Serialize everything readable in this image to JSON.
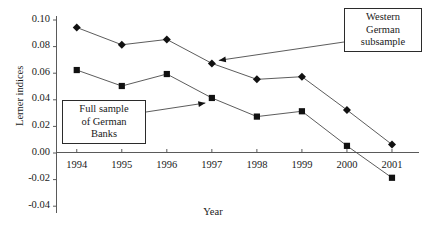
{
  "chart_data": {
    "type": "line",
    "title": "",
    "xlabel": "Year",
    "ylabel": "Lerner indices",
    "categories": [
      "1994",
      "1995",
      "1996",
      "1997",
      "1998",
      "1999",
      "2000",
      "2001"
    ],
    "x": [
      1994,
      1995,
      1996,
      1997,
      1998,
      1999,
      2000,
      2001
    ],
    "xlim": [
      1993.55,
      2001.6
    ],
    "ylim": [
      -0.04,
      0.1
    ],
    "yticks": [
      0.1,
      0.08,
      0.06,
      0.04,
      0.02,
      0.0,
      -0.02,
      -0.04
    ],
    "ytick_labels": [
      "0.10",
      "0.08",
      "0.06",
      "0.04",
      "0.02",
      "0.00",
      "-0.02",
      "-0.04"
    ],
    "grid": false,
    "legend_position": "annotations",
    "series": [
      {
        "name": "Western German subsample",
        "marker": "diamond",
        "values": [
          0.094,
          0.081,
          0.085,
          0.067,
          0.055,
          0.057,
          0.032,
          0.006
        ]
      },
      {
        "name": "Full sample of German Banks",
        "marker": "square",
        "values": [
          0.062,
          0.05,
          0.059,
          0.041,
          0.027,
          0.031,
          0.005,
          -0.019
        ]
      }
    ],
    "annotations": [
      {
        "id": "full-sample",
        "lines": [
          "Full sample",
          "of  German",
          "Banks"
        ],
        "points_to_series": "Full sample of German Banks",
        "points_to_x": 1997
      },
      {
        "id": "western-subsample",
        "lines": [
          "Western",
          "German",
          "subsample"
        ],
        "points_to_series": "Western German subsample",
        "points_to_x": 1997
      }
    ]
  },
  "colors": {
    "axis": "#5a5a5a",
    "series_line": "#4a4a4a",
    "marker": "#111111",
    "text": "#1a1a1a",
    "box_border": "#2b2b2b",
    "background": "#ffffff"
  }
}
